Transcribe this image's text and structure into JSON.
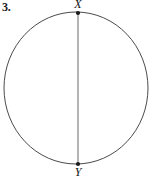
{
  "figure": {
    "problem_number": "3.",
    "description_type": "circle-with-vertical-diameter",
    "circle": {
      "center_x": 76,
      "center_y": 88,
      "radius_x": 72,
      "radius_y": 76,
      "stroke_color": "#4a4a4a",
      "stroke_width": 1,
      "fill": "none"
    },
    "diameter": {
      "from_label": "X",
      "to_label": "Y",
      "x": 78,
      "y_top": 13,
      "y_bottom": 164,
      "stroke_color": "#6b6b6b",
      "stroke_width": 1
    },
    "points": [
      {
        "label": "X",
        "x": 78,
        "y": 13,
        "dot_radius": 2,
        "dot_color": "#1a1a1a",
        "label_position": "above"
      },
      {
        "label": "Y",
        "x": 78,
        "y": 164,
        "dot_radius": 2,
        "dot_color": "#1a1a1a",
        "label_position": "below"
      }
    ],
    "background_color": "#ffffff"
  }
}
